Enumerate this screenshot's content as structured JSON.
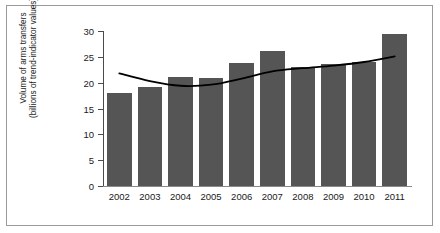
{
  "chart_data": {
    "type": "bar",
    "title": "",
    "subtitle": "",
    "xlabel": "",
    "ylabel": "Volume of arms transfers (billions of trend-indicator values)",
    "ylabel_line1": "Volume of arms transfers",
    "ylabel_line2": "(billions of trend-indicator values)",
    "categories": [
      "2002",
      "2003",
      "2004",
      "2005",
      "2006",
      "2007",
      "2008",
      "2009",
      "2010",
      "2011"
    ],
    "values": [
      18.0,
      19.2,
      21.1,
      20.9,
      23.8,
      26.1,
      23.0,
      23.6,
      24.0,
      29.5
    ],
    "ylim": [
      0,
      30
    ],
    "yticks": [
      0,
      5,
      10,
      15,
      20,
      25,
      30
    ],
    "ytick_labels": [
      "0",
      "5",
      "10",
      "15",
      "20",
      "25",
      "30"
    ],
    "grid": false,
    "legend": "none",
    "bar_color": "#555555",
    "series": [
      {
        "name": "Volume of arms transfers",
        "type": "bar",
        "values": [
          18.0,
          19.2,
          21.1,
          20.9,
          23.8,
          26.1,
          23.0,
          23.6,
          24.0,
          29.5
        ]
      },
      {
        "name": "Trend line (5-year moving average)",
        "type": "line",
        "color": "#000000",
        "values": [
          21.8,
          20.3,
          19.4,
          19.6,
          20.8,
          22.2,
          22.8,
          23.3,
          24.0,
          25.1
        ]
      }
    ]
  },
  "figure": {
    "border_color": "#9a9a9a",
    "background": "#ffffff",
    "axis_color": "#4a4a4a"
  }
}
